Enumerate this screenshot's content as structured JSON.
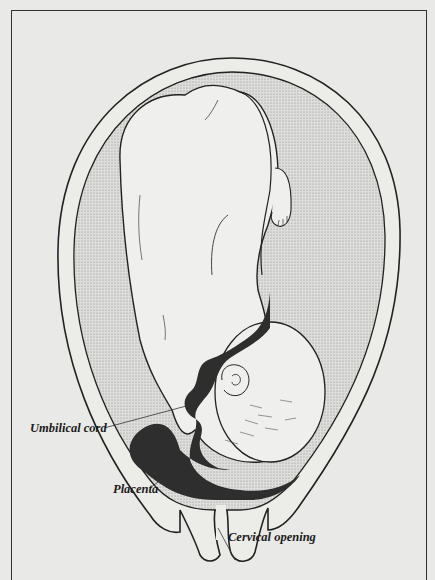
{
  "figure": {
    "labels": {
      "umbilical_cord": "Umbilical cord",
      "placenta": "Placenta",
      "cervical_opening": "Cervical opening"
    }
  },
  "colors": {
    "background": "#e9e9e7",
    "line": "#222222",
    "placenta_fill": "#2e2e2e",
    "amniotic_stipple": "#c9c9c7",
    "uterine_wall": "#ececea"
  }
}
